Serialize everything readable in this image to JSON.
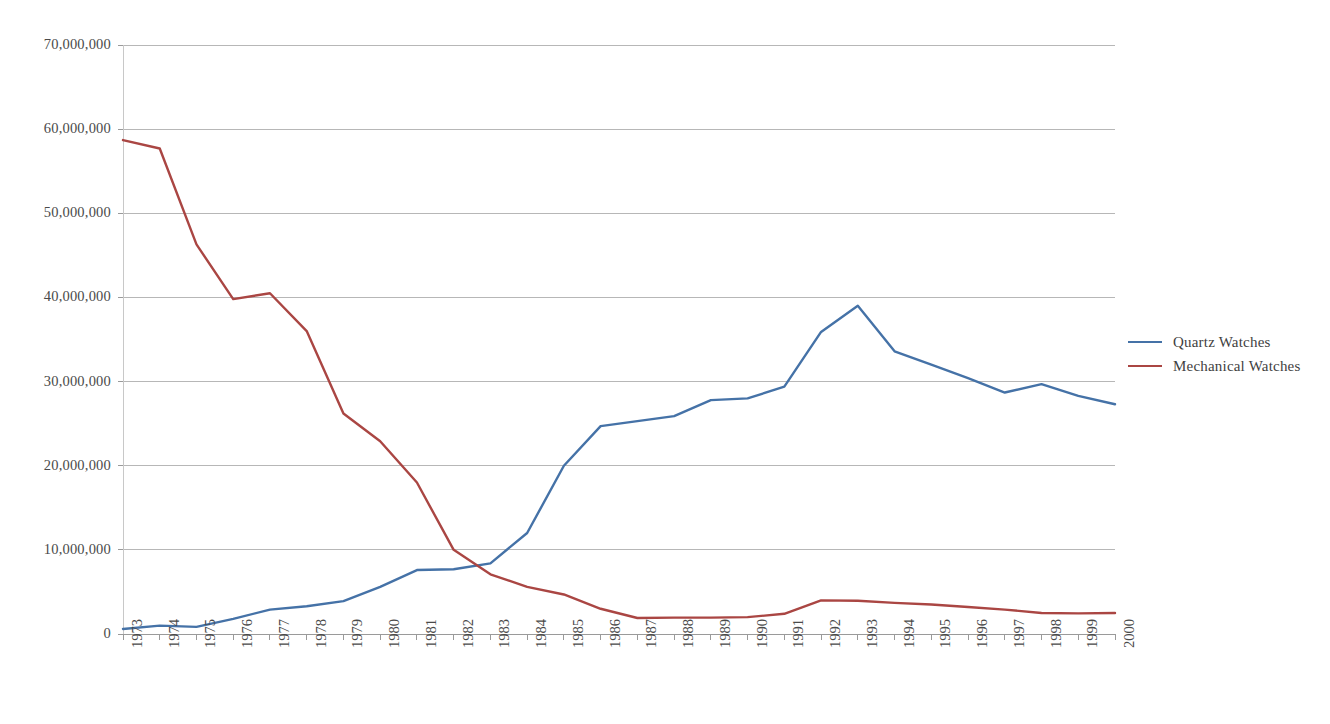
{
  "chart_data": {
    "type": "line",
    "title": "",
    "xlabel": "",
    "ylabel": "",
    "categories": [
      1973,
      1974,
      1975,
      1976,
      1977,
      1978,
      1979,
      1980,
      1981,
      1982,
      1983,
      1984,
      1985,
      1986,
      1987,
      1988,
      1989,
      1990,
      1991,
      1992,
      1993,
      1994,
      1995,
      1996,
      1997,
      1998,
      1999,
      2000
    ],
    "x_tick_labels": [
      "1973",
      "1974",
      "1975",
      "1976",
      "1977",
      "1978",
      "1979",
      "1980",
      "1981",
      "1982",
      "1983",
      "1984",
      "1985",
      "1986",
      "1987",
      "1988",
      "1989",
      "1990",
      "1991",
      "1992",
      "1993",
      "1994",
      "1995",
      "1996",
      "1997",
      "1998",
      "1999",
      "2000"
    ],
    "y_tick_labels": [
      "70,000,000",
      "60,000,000",
      "50,000,000",
      "40,000,000",
      "30,000,000",
      "20,000,000",
      "10,000,000",
      "0"
    ],
    "y_tick_values": [
      70000000,
      60000000,
      50000000,
      40000000,
      30000000,
      20000000,
      10000000,
      0
    ],
    "ylim": [
      0,
      70000000
    ],
    "grid": true,
    "legend_position": "right",
    "series": [
      {
        "name": "Quartz Watches",
        "color": "#4572a7",
        "values": [
          600000,
          1000000,
          850000,
          1800000,
          2900000,
          3300000,
          3900000,
          5600000,
          7600000,
          7700000,
          8400000,
          12000000,
          20000000,
          24700000,
          25300000,
          25900000,
          27800000,
          28000000,
          29400000,
          35900000,
          39000000,
          33600000,
          32000000,
          30400000,
          28700000,
          29700000,
          28300000,
          27300000
        ]
      },
      {
        "name": "Mechanical Watches",
        "color": "#aa4643",
        "values": [
          58700000,
          57700000,
          46300000,
          39800000,
          40500000,
          36000000,
          26200000,
          22900000,
          18000000,
          10000000,
          7100000,
          5600000,
          4700000,
          3000000,
          1900000,
          1950000,
          1950000,
          2000000,
          2400000,
          4000000,
          3950000,
          3700000,
          3500000,
          3200000,
          2900000,
          2500000,
          2450000,
          2500000
        ]
      }
    ]
  },
  "legend": {
    "items": [
      {
        "label": "Quartz Watches",
        "color": "#4572a7"
      },
      {
        "label": "Mechanical Watches",
        "color": "#aa4643"
      }
    ]
  },
  "axes": {
    "y_labels": [
      "70,000,000",
      "60,000,000",
      "50,000,000",
      "40,000,000",
      "30,000,000",
      "20,000,000",
      "10,000,000",
      "0"
    ],
    "x_labels": [
      "1973",
      "1974",
      "1975",
      "1976",
      "1977",
      "1978",
      "1979",
      "1980",
      "1981",
      "1982",
      "1983",
      "1984",
      "1985",
      "1986",
      "1987",
      "1988",
      "1989",
      "1990",
      "1991",
      "1992",
      "1993",
      "1994",
      "1995",
      "1996",
      "1997",
      "1998",
      "1999",
      "2000"
    ]
  },
  "style": {
    "grid_color": "#b7b7b7",
    "axis_color": "#9a9a9a",
    "plot_background": "#ffffff"
  }
}
